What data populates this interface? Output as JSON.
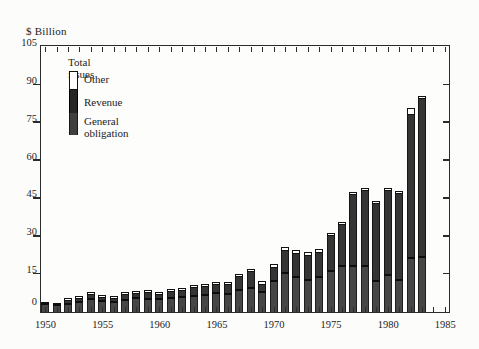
{
  "title": "$ Billion",
  "legend": {
    "title": "Total issues",
    "items": [
      {
        "label": "Other",
        "color": "#ffffff"
      },
      {
        "label": "Revenue",
        "color": "#262626"
      },
      {
        "label": "General obligation",
        "color": "#464646"
      }
    ]
  },
  "axis": {
    "y_unit_label": "$ Billion",
    "y_tick_labels": [
      "0",
      "15",
      "30",
      "45",
      "60",
      "75",
      "90",
      "105"
    ],
    "x_tick_labels": [
      "1950",
      "1955",
      "1960",
      "1965",
      "1970",
      "1975",
      "1980",
      "1985"
    ]
  },
  "chart_data": {
    "type": "bar",
    "stacked": true,
    "title": "$ Billion",
    "xlabel": "",
    "ylabel": "$ Billion",
    "ylim": [
      0,
      105
    ],
    "y_tick_interval": 15,
    "yticks": [
      0,
      15,
      30,
      45,
      60,
      75,
      90,
      105
    ],
    "x_range": [
      1950,
      1985
    ],
    "x_labeled_ticks": [
      1950,
      1955,
      1960,
      1965,
      1970,
      1975,
      1980,
      1985
    ],
    "x_minor_tick_every": 1,
    "grid": false,
    "legend_position": "upper-left-inside",
    "categories": [
      1950,
      1951,
      1952,
      1953,
      1954,
      1955,
      1956,
      1957,
      1958,
      1959,
      1960,
      1961,
      1962,
      1963,
      1964,
      1965,
      1966,
      1967,
      1968,
      1969,
      1970,
      1971,
      1972,
      1973,
      1974,
      1975,
      1976,
      1977,
      1978,
      1979,
      1980,
      1981,
      1982,
      1983
    ],
    "series": [
      {
        "name": "General obligation",
        "color": "#464646",
        "values": [
          2.7,
          2.2,
          2.8,
          3.4,
          4.6,
          3.9,
          3.5,
          4.5,
          5.0,
          4.8,
          4.6,
          5.3,
          5.5,
          5.8,
          6.4,
          7.3,
          6.8,
          8.3,
          9.3,
          7.7,
          11.8,
          15.2,
          13.3,
          12.3,
          13.6,
          16.0,
          18.0,
          18.0,
          17.9,
          12.1,
          14.1,
          12.4,
          21.1,
          21.6
        ]
      },
      {
        "name": "Revenue",
        "color": "#262626",
        "values": [
          1.2,
          1.2,
          1.4,
          1.8,
          2.1,
          1.8,
          1.7,
          2.2,
          2.2,
          2.6,
          2.3,
          2.8,
          2.8,
          3.8,
          3.6,
          3.3,
          3.8,
          5.5,
          6.6,
          3.1,
          5.6,
          9.1,
          9.7,
          10.0,
          9.7,
          14.0,
          16.5,
          28.3,
          30.1,
          30.9,
          33.8,
          34.2,
          57.1,
          62.9
        ]
      },
      {
        "name": "Other",
        "color": "#ffffff",
        "values": [
          0.1,
          0.1,
          0.3,
          0.3,
          0.3,
          0.3,
          0.3,
          0.3,
          0.3,
          0.3,
          0.3,
          0.3,
          0.3,
          0.5,
          0.5,
          0.5,
          0.5,
          0.5,
          0.5,
          0.7,
          0.7,
          0.7,
          0.7,
          0.7,
          0.7,
          0.5,
          0.5,
          0.5,
          0.5,
          0.5,
          0.5,
          0.5,
          1.8,
          0.3
        ]
      }
    ],
    "totals": [
      4.0,
      3.5,
      4.5,
      5.5,
      7.0,
      6.0,
      5.5,
      7.0,
      7.5,
      7.7,
      7.2,
      8.4,
      8.6,
      10.1,
      10.5,
      11.1,
      11.1,
      14.3,
      16.4,
      11.5,
      18.1,
      25.0,
      23.7,
      23.0,
      24.0,
      30.5,
      35.0,
      46.8,
      48.5,
      43.5,
      48.4,
      47.1,
      80.0,
      84.8
    ]
  }
}
